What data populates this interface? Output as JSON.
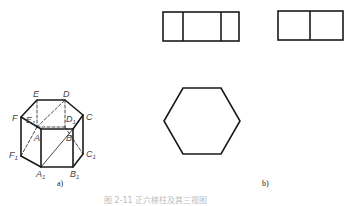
{
  "figure": {
    "caption": "图 2-11 正六棱柱及其三视图",
    "subfigures": [
      {
        "id": "a",
        "label": "a)",
        "description": "Isometric view of a regular hexagonal prism",
        "vertex_labels": {
          "E": "E",
          "D": "D",
          "F": "F",
          "C": "C",
          "A": "A",
          "B": "B",
          "E1": "E",
          "D1": "D",
          "F1": "F",
          "A1": "A",
          "B1": "B",
          "C1": "C",
          "sub": "1"
        }
      },
      {
        "id": "b",
        "label": "b)",
        "description": "Three orthographic views: front view, side view, top view (hexagon)",
        "views": [
          "front-view",
          "left-side-view",
          "top-view"
        ]
      }
    ]
  }
}
